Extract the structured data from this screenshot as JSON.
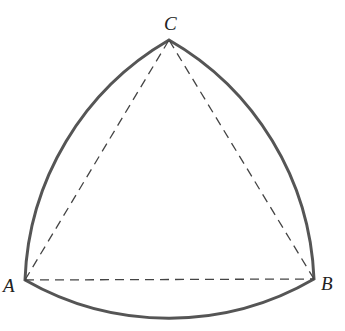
{
  "diagram": {
    "vertices": {
      "A": {
        "label": "A",
        "x": 25,
        "y": 280
      },
      "B": {
        "label": "B",
        "x": 314,
        "y": 279
      },
      "C": {
        "label": "C",
        "x": 169,
        "y": 40
      }
    },
    "arc_radius": 289,
    "colors": {
      "arc": "#555555",
      "dashed": "#444444",
      "text": "#222222"
    }
  }
}
